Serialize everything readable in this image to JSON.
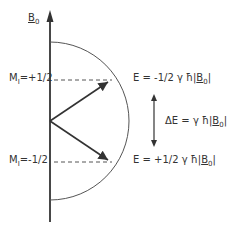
{
  "axis": {
    "label_main": "B",
    "label_sub": "0"
  },
  "levels": [
    {
      "m_label": "M",
      "m_sub": "I",
      "m_value": "=+1/2",
      "energy_prefix": "E = -1/2 γ ħ|",
      "energy_b": "B",
      "energy_b_sub": "0",
      "energy_suffix": "|"
    },
    {
      "m_label": "M",
      "m_sub": "I",
      "m_value": "=-1/2",
      "energy_prefix": "E = +1/2 γ ħ|",
      "energy_b": "B",
      "energy_b_sub": "0",
      "energy_suffix": "|"
    }
  ],
  "delta": {
    "prefix": "ΔE = γ ħ|",
    "b": "B",
    "b_sub": "0",
    "suffix": "|"
  },
  "colors": {
    "line": "#333333"
  }
}
